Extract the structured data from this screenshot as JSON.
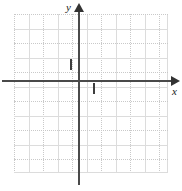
{
  "figure": {
    "kind": "cartesian-coordinate-plane",
    "width": 182,
    "height": 191,
    "background_color": "#ffffff"
  },
  "axes": {
    "x_label": "x",
    "y_label": "y",
    "axis_color": "#4a4a4a",
    "arrow_color": "#333333",
    "origin_px": {
      "x": 79,
      "y": 81
    },
    "x_axis_extent_px": {
      "start": 2,
      "end": 174
    },
    "y_axis_extent_px": {
      "start": 8,
      "end": 185
    }
  },
  "ticks": {
    "unit_tick_color": "#3d3d3d",
    "x_unit_tick": {
      "value": 1,
      "px_x": 93,
      "label": ""
    },
    "y_unit_tick": {
      "value": 1,
      "px_y": 64,
      "label": ""
    }
  },
  "grid": {
    "solid_color": "#dcdcdc",
    "dotted_color": "#c9c9c9",
    "spacing_px": 14.5,
    "left_px": 14,
    "top_px": 14,
    "width_px": 154,
    "height_px": 159,
    "vertical_lines": [
      {
        "offset": 0,
        "style": "dotted"
      },
      {
        "offset": 14.5,
        "style": "solid"
      },
      {
        "offset": 29,
        "style": "dotted"
      },
      {
        "offset": 43.5,
        "style": "solid"
      },
      {
        "offset": 58,
        "style": "dotted"
      },
      {
        "offset": 72.5,
        "style": "solid"
      },
      {
        "offset": 87,
        "style": "dotted"
      },
      {
        "offset": 101.5,
        "style": "solid"
      },
      {
        "offset": 116,
        "style": "dotted"
      },
      {
        "offset": 130.5,
        "style": "solid"
      },
      {
        "offset": 145,
        "style": "dotted"
      },
      {
        "offset": 153,
        "style": "solid"
      }
    ],
    "horizontal_lines": [
      {
        "offset": 0,
        "style": "dotted"
      },
      {
        "offset": 14.5,
        "style": "solid"
      },
      {
        "offset": 29,
        "style": "dotted"
      },
      {
        "offset": 43.5,
        "style": "solid"
      },
      {
        "offset": 58,
        "style": "dotted"
      },
      {
        "offset": 72.5,
        "style": "solid"
      },
      {
        "offset": 87,
        "style": "dotted"
      },
      {
        "offset": 101.5,
        "style": "solid"
      },
      {
        "offset": 116,
        "style": "dotted"
      },
      {
        "offset": 130.5,
        "style": "solid"
      },
      {
        "offset": 145,
        "style": "dotted"
      },
      {
        "offset": 158,
        "style": "solid"
      }
    ]
  },
  "chart_data": {
    "type": "scatter",
    "title": "",
    "subtitle": "",
    "xlabel": "x",
    "ylabel": "y",
    "xlim": [
      -4.5,
      6.2
    ],
    "ylim": [
      -6.3,
      4.6
    ],
    "x_tick_interval": 1,
    "y_tick_interval": 1,
    "labeled_ticks": {
      "x": [
        1
      ],
      "y": [
        1
      ]
    },
    "grid": true,
    "legend": null,
    "annotations": [],
    "series": [
      {
        "name": "",
        "x": [],
        "y": []
      }
    ],
    "note": "Empty Cartesian grid: no plotted data points or curves are drawn."
  }
}
